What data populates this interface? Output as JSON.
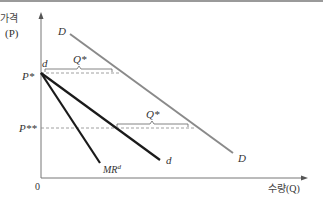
{
  "diagram": {
    "y_axis_label": "가격",
    "y_axis_var": "(P)",
    "x_axis_label": "수량",
    "x_axis_var": "(Q)",
    "origin_label": "0",
    "price_labels": {
      "p_star": "P*",
      "p_star_star": "P**"
    },
    "curves": {
      "market_demand": {
        "label_start": "D",
        "label_end": "D",
        "color": "#8a8a8a"
      },
      "firm_demand": {
        "label_start": "d",
        "label_end": "d",
        "color": "#1a1a1a"
      },
      "marginal_revenue": {
        "label": "MR",
        "superscript": "d",
        "color": "#1a1a1a"
      }
    },
    "brackets": [
      {
        "label": "Q*",
        "level": "P*"
      },
      {
        "label": "Q*",
        "level": "P**"
      }
    ]
  }
}
